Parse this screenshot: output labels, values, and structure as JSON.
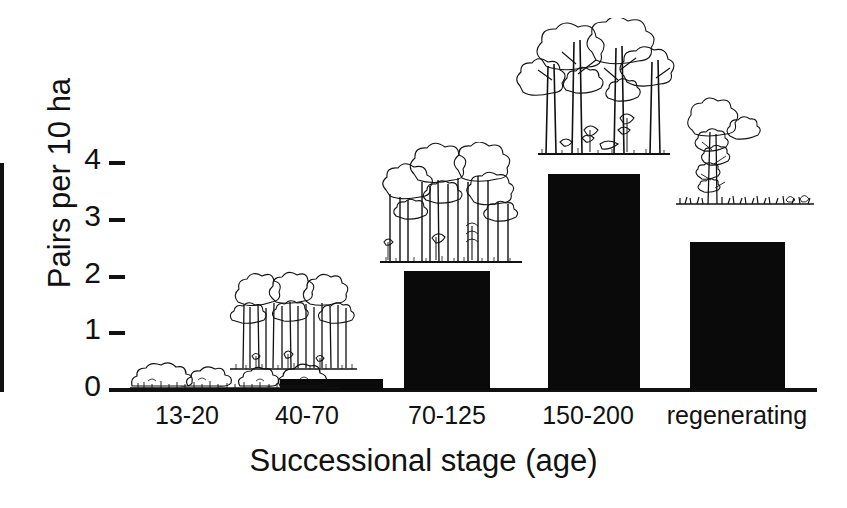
{
  "chart_data": {
    "type": "bar",
    "title": "",
    "xlabel": "Successional stage (age)",
    "ylabel": "Pairs per 10 ha",
    "categories": [
      "13-20",
      "40-70",
      "70-125",
      "150-200",
      "regenerating"
    ],
    "values": [
      0.0,
      0.2,
      2.1,
      3.8,
      2.6
    ],
    "ylim": [
      0,
      4
    ],
    "yticks": [
      "0",
      "1",
      "2",
      "3",
      "4"
    ],
    "grid": false,
    "legend": null,
    "bar_color": "#0a0a0a",
    "annotations": [
      {
        "category": "13-20",
        "illustration": "low-shrub-scrub-vegetation"
      },
      {
        "category": "40-70",
        "illustration": "young-dense-sapling-forest"
      },
      {
        "category": "70-125",
        "illustration": "mid-height-closed-canopy-forest"
      },
      {
        "category": "150-200",
        "illustration": "tall-mature-old-growth-forest"
      },
      {
        "category": "regenerating",
        "illustration": "single-isolated-tree-over-grass"
      }
    ]
  },
  "axis": {
    "y_title": "Pairs per 10 ha",
    "x_title": "Successional stage (age)",
    "y_ticks": [
      "0",
      "1",
      "2",
      "3",
      "4"
    ],
    "x_ticks": [
      "13-20",
      "40-70",
      "70-125",
      "150-200",
      "regenerating"
    ]
  }
}
